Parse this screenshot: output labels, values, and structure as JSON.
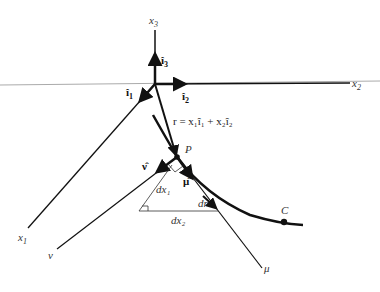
{
  "diagram": {
    "axes": {
      "x1": "x",
      "x1_sub": "1",
      "x2": "x",
      "x2_sub": "2",
      "x3": "x",
      "x3_sub": "3"
    },
    "unit_vectors": {
      "i1": "î",
      "i1_sub": "1",
      "i2": "î",
      "i2_sub": "2",
      "i3": "î",
      "i3_sub": "3"
    },
    "position_vector": "r = x₁î₁ + x₂î₂",
    "point_P": "P",
    "curve_label": "C",
    "normal_label": "ν̂",
    "tangent_label": "μ̂",
    "normal_axis": "ν",
    "tangent_axis": "μ",
    "dx1": "dx₁",
    "dx2": "dx₂",
    "dr": "dr"
  }
}
